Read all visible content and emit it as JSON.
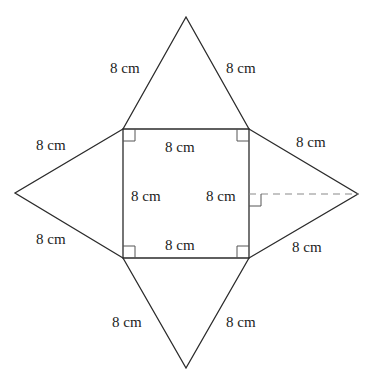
{
  "diagram": {
    "type": "net-of-square-pyramid",
    "colors": {
      "line": "#2b2b2b",
      "dashed": "#8a8a8a",
      "text": "#222222",
      "background": "#ffffff"
    },
    "labels": {
      "top_left": "8 cm",
      "top_right": "8 cm",
      "left_upper": "8 cm",
      "left_lower": "8 cm",
      "right_upper": "8 cm",
      "right_lower": "8 cm",
      "bottom_left": "8 cm",
      "bottom_right": "8 cm",
      "square_top": "8 cm",
      "square_bottom": "8 cm",
      "square_left": "8 cm",
      "square_right": "8 cm"
    }
  }
}
